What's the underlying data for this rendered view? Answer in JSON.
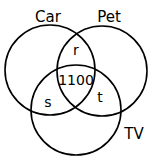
{
  "diagram": {
    "type": "venn",
    "sets": [
      {
        "name": "Car",
        "cx": 50,
        "cy": 70,
        "r": 45,
        "label_x": 48,
        "label_y": 22
      },
      {
        "name": "Pet",
        "cx": 102,
        "cy": 71,
        "r": 45,
        "label_x": 109,
        "label_y": 22
      },
      {
        "name": "TV",
        "cx": 76,
        "cy": 110,
        "r": 45,
        "label_x": 134,
        "label_y": 139
      }
    ],
    "regions": [
      {
        "id": "car_pet",
        "label": "r",
        "x": 76,
        "y": 55
      },
      {
        "id": "car_pet_tv",
        "label": "1100",
        "x": 76,
        "y": 85
      },
      {
        "id": "car_tv",
        "label": "s",
        "x": 48,
        "y": 107
      },
      {
        "id": "pet_tv",
        "label": "t",
        "x": 100,
        "y": 102
      }
    ],
    "stroke_color": "#000000",
    "background": "#ffffff"
  }
}
